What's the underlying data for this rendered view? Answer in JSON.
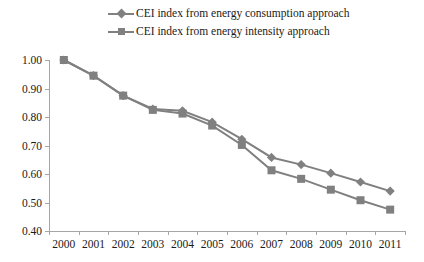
{
  "legend": {
    "position": "top-center",
    "entries": [
      {
        "label": "CEI index from energy consumption approach",
        "marker": "diamond",
        "color": "#808080"
      },
      {
        "label": "CEI index from energy intensity approach",
        "marker": "square",
        "color": "#808080"
      }
    ]
  },
  "axes": {
    "y_ticks": [
      "1.00",
      "0.90",
      "0.80",
      "0.70",
      "0.60",
      "0.50",
      "0.40"
    ],
    "x_ticks": [
      "2000",
      "2001",
      "2002",
      "2003",
      "2004",
      "2005",
      "2006",
      "2007",
      "2008",
      "2009",
      "2010",
      "2011"
    ]
  },
  "chart_data": {
    "type": "line",
    "title": "",
    "xlabel": "",
    "ylabel": "",
    "categories": [
      "2000",
      "2001",
      "2002",
      "2003",
      "2004",
      "2005",
      "2006",
      "2007",
      "2008",
      "2009",
      "2010",
      "2011"
    ],
    "series": [
      {
        "name": "CEI index from energy consumption approach",
        "marker": "diamond",
        "color": "#808080",
        "values": [
          1.0,
          0.945,
          0.875,
          0.828,
          0.822,
          0.782,
          0.722,
          0.658,
          0.633,
          0.603,
          0.572,
          0.54
        ]
      },
      {
        "name": "CEI index from energy intensity approach",
        "marker": "square",
        "color": "#808080",
        "values": [
          1.0,
          0.945,
          0.875,
          0.825,
          0.812,
          0.77,
          0.702,
          0.613,
          0.583,
          0.545,
          0.508,
          0.475
        ]
      }
    ],
    "ylim": [
      0.4,
      1.0
    ],
    "ytick_step": 0.1,
    "grid": false,
    "legend_position": "top-center"
  }
}
